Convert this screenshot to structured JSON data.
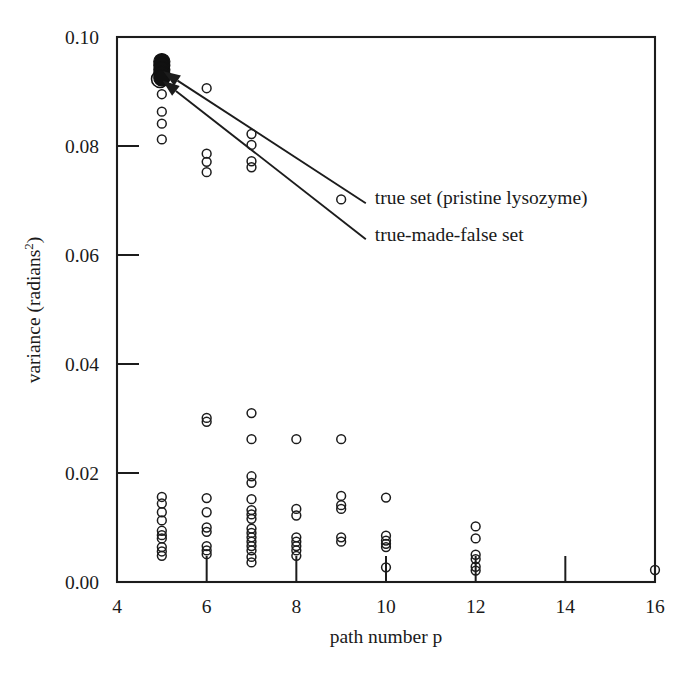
{
  "figure": {
    "background_color": "#ffffff",
    "ink_color": "#1c1c1c",
    "width": 687,
    "height": 673
  },
  "annotations": [
    {
      "id": "true-set",
      "text": "true set (pristine lysozyme)"
    },
    {
      "id": "true-made-false-set",
      "text": "true-made-false set"
    }
  ],
  "chart_data": {
    "type": "scatter",
    "title": "",
    "xlabel": "path number p",
    "ylabel": "variance (radians",
    "ylabel_sup": "2",
    "ylabel_tail": ")",
    "xlim": [
      4,
      16
    ],
    "ylim": [
      0.0,
      0.1
    ],
    "xticks": [
      4,
      6,
      8,
      10,
      12,
      14,
      16
    ],
    "xticklabels": [
      "4",
      "6",
      "8",
      "10",
      "12",
      "14",
      "16"
    ],
    "yticks": [
      0.0,
      0.02,
      0.04,
      0.06,
      0.08,
      0.1
    ],
    "yticklabels": [
      "0.00",
      "0.02",
      "0.04",
      "0.06",
      "0.08",
      "0.10"
    ],
    "grid": false,
    "legend": "none",
    "annotations": [
      {
        "label": "true set (pristine lysozyme)",
        "text_x": 9.75,
        "text_y": 0.0705,
        "arrow_to": [
          5.07,
          0.0935
        ],
        "arrow_from": [
          9.55,
          0.0695
        ]
      },
      {
        "label": "true-made-false set",
        "text_x": 9.75,
        "text_y": 0.0637,
        "arrow_to": [
          5.05,
          0.0918
        ],
        "arrow_from": [
          9.55,
          0.0629
        ]
      }
    ],
    "series": [
      {
        "name": "true set (pristine lysozyme)",
        "marker": "filled-circle",
        "points": [
          {
            "x": 5,
            "y": 0.0955
          },
          {
            "x": 5,
            "y": 0.0948
          },
          {
            "x": 5,
            "y": 0.094
          },
          {
            "x": 5,
            "y": 0.0932
          },
          {
            "x": 5,
            "y": 0.0925
          }
        ]
      },
      {
        "name": "true-made-false set",
        "marker": "open-circle-large",
        "points": [
          {
            "x": 4.96,
            "y": 0.0923
          }
        ]
      },
      {
        "name": "false sets",
        "marker": "open-circle",
        "points": [
          {
            "x": 5,
            "y": 0.0895
          },
          {
            "x": 5,
            "y": 0.0863
          },
          {
            "x": 5,
            "y": 0.0841
          },
          {
            "x": 5,
            "y": 0.0812
          },
          {
            "x": 5,
            "y": 0.0156
          },
          {
            "x": 5,
            "y": 0.0144
          },
          {
            "x": 5,
            "y": 0.0128
          },
          {
            "x": 5,
            "y": 0.0113
          },
          {
            "x": 5,
            "y": 0.0094
          },
          {
            "x": 5,
            "y": 0.0086
          },
          {
            "x": 5,
            "y": 0.008
          },
          {
            "x": 5,
            "y": 0.0064
          },
          {
            "x": 5,
            "y": 0.0056
          },
          {
            "x": 5,
            "y": 0.0048
          },
          {
            "x": 6,
            "y": 0.0906
          },
          {
            "x": 6,
            "y": 0.0786
          },
          {
            "x": 6,
            "y": 0.0771
          },
          {
            "x": 6,
            "y": 0.0752
          },
          {
            "x": 6,
            "y": 0.0301
          },
          {
            "x": 6,
            "y": 0.0294
          },
          {
            "x": 6,
            "y": 0.0154
          },
          {
            "x": 6,
            "y": 0.0128
          },
          {
            "x": 6,
            "y": 0.01
          },
          {
            "x": 6,
            "y": 0.0092
          },
          {
            "x": 6,
            "y": 0.0066
          },
          {
            "x": 6,
            "y": 0.0058
          },
          {
            "x": 6,
            "y": 0.0051
          },
          {
            "x": 7,
            "y": 0.0822
          },
          {
            "x": 7,
            "y": 0.0802
          },
          {
            "x": 7,
            "y": 0.0772
          },
          {
            "x": 7,
            "y": 0.0761
          },
          {
            "x": 7,
            "y": 0.031
          },
          {
            "x": 7,
            "y": 0.0262
          },
          {
            "x": 7,
            "y": 0.0194
          },
          {
            "x": 7,
            "y": 0.0182
          },
          {
            "x": 7,
            "y": 0.0152
          },
          {
            "x": 7,
            "y": 0.0132
          },
          {
            "x": 7,
            "y": 0.0124
          },
          {
            "x": 7,
            "y": 0.0116
          },
          {
            "x": 7,
            "y": 0.0098
          },
          {
            "x": 7,
            "y": 0.009
          },
          {
            "x": 7,
            "y": 0.0082
          },
          {
            "x": 7,
            "y": 0.0074
          },
          {
            "x": 7,
            "y": 0.0066
          },
          {
            "x": 7,
            "y": 0.0058
          },
          {
            "x": 7,
            "y": 0.0046
          },
          {
            "x": 7,
            "y": 0.0036
          },
          {
            "x": 8,
            "y": 0.0262
          },
          {
            "x": 8,
            "y": 0.0134
          },
          {
            "x": 8,
            "y": 0.0122
          },
          {
            "x": 8,
            "y": 0.0082
          },
          {
            "x": 8,
            "y": 0.0074
          },
          {
            "x": 8,
            "y": 0.0066
          },
          {
            "x": 8,
            "y": 0.0058
          },
          {
            "x": 8,
            "y": 0.0048
          },
          {
            "x": 9,
            "y": 0.0702
          },
          {
            "x": 9,
            "y": 0.0262
          },
          {
            "x": 9,
            "y": 0.0158
          },
          {
            "x": 9,
            "y": 0.0141
          },
          {
            "x": 9,
            "y": 0.0134
          },
          {
            "x": 9,
            "y": 0.0082
          },
          {
            "x": 9,
            "y": 0.0074
          },
          {
            "x": 10,
            "y": 0.0155
          },
          {
            "x": 10,
            "y": 0.0085
          },
          {
            "x": 10,
            "y": 0.0076
          },
          {
            "x": 10,
            "y": 0.007
          },
          {
            "x": 10,
            "y": 0.0064
          },
          {
            "x": 10,
            "y": 0.0027
          },
          {
            "x": 12,
            "y": 0.0102
          },
          {
            "x": 12,
            "y": 0.008
          },
          {
            "x": 12,
            "y": 0.005
          },
          {
            "x": 12,
            "y": 0.0042
          },
          {
            "x": 12,
            "y": 0.0028
          },
          {
            "x": 12,
            "y": 0.0021
          },
          {
            "x": 16,
            "y": 0.0022
          }
        ]
      }
    ]
  }
}
